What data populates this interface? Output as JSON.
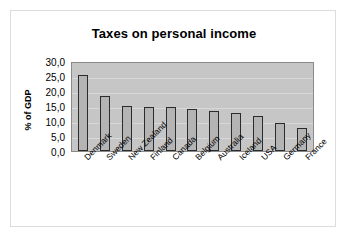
{
  "chart_data": {
    "type": "bar",
    "title": "Taxes on personal income",
    "xlabel": "",
    "ylabel": "% of GDP",
    "ylim": [
      0.0,
      30.0
    ],
    "ytick_step": 5.0,
    "grid": true,
    "legend": "none",
    "decimal_separator": ",",
    "ytick_labels": [
      "30,0",
      "25,0",
      "20,0",
      "15,0",
      "10,0",
      "5,0",
      "0,0"
    ],
    "ytick_values": [
      30.0,
      25.0,
      20.0,
      15.0,
      10.0,
      5.0,
      0.0
    ],
    "categories": [
      "Denmark",
      "Sweden",
      "New Zealand",
      "Finland",
      "Canada",
      "Belgium",
      "Australia",
      "Iceland",
      "USA",
      "Germany",
      "France"
    ],
    "values": [
      25.5,
      18.5,
      15.0,
      14.8,
      14.7,
      14.1,
      13.2,
      12.6,
      11.8,
      9.3,
      7.8
    ],
    "series": [
      {
        "name": "% of GDP",
        "values": [
          25.5,
          18.5,
          15.0,
          14.8,
          14.7,
          14.1,
          13.2,
          12.6,
          11.8,
          9.3,
          7.8
        ]
      }
    ],
    "colors": {
      "bar_fill": "#b4b4b4",
      "bar_border": "#2b2b2b",
      "plot_background": "#c6c6c6",
      "gridline": "#d8d8d8",
      "figure_background": "#ffffff",
      "text": "#000000",
      "frame": "#dcdcdc"
    }
  }
}
